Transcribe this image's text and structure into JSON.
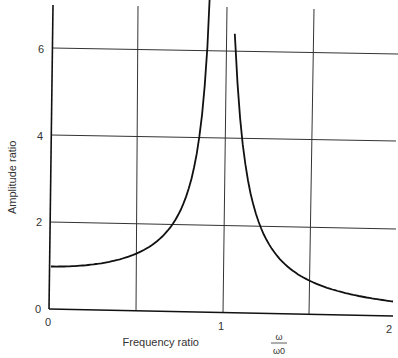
{
  "chart_data": {
    "type": "line",
    "title": "",
    "xlabel": "Frequency ratio",
    "xlabel_fraction": {
      "numerator": "ω",
      "denominator": "ω0"
    },
    "ylabel": "Amplitude ratio",
    "xlim": [
      0,
      2
    ],
    "ylim": [
      0,
      7
    ],
    "x_ticks": [
      "0",
      "1",
      "2"
    ],
    "y_ticks": [
      "0",
      "2",
      "4",
      "6"
    ],
    "grid": {
      "vertical_at": [
        0.5,
        1.0,
        1.5
      ],
      "horizontal_at": [
        2,
        4,
        6
      ]
    },
    "legend": null,
    "series": [
      {
        "name": "Amplitude ratio (undamped, 1/|1 - r^2|)",
        "x": [
          0,
          0.1,
          0.2,
          0.3,
          0.4,
          0.5,
          0.6,
          0.7,
          0.75,
          0.8,
          0.85,
          0.9,
          0.92,
          0.93
        ],
        "y": [
          1.0,
          1.01,
          1.04,
          1.1,
          1.19,
          1.33,
          1.56,
          1.96,
          2.29,
          2.78,
          3.6,
          5.26,
          5.96,
          6.4
        ]
      },
      {
        "name": "Amplitude ratio (above resonance)",
        "x": [
          1.075,
          1.1,
          1.15,
          1.2,
          1.3,
          1.4,
          1.5,
          1.6,
          1.7,
          1.8,
          1.9,
          2.0
        ],
        "y": [
          6.4,
          4.76,
          3.1,
          2.27,
          1.45,
          1.04,
          0.8,
          0.64,
          0.53,
          0.45,
          0.38,
          0.33
        ]
      }
    ]
  },
  "axes": {
    "x_tick_labels": [
      "0",
      "1",
      "2"
    ],
    "y_tick_labels": [
      "0",
      "2",
      "4",
      "6"
    ],
    "xlabel": "Frequency ratio",
    "frac_num": "ω",
    "frac_den": "ω0",
    "ylabel": "Amplitude ratio"
  }
}
